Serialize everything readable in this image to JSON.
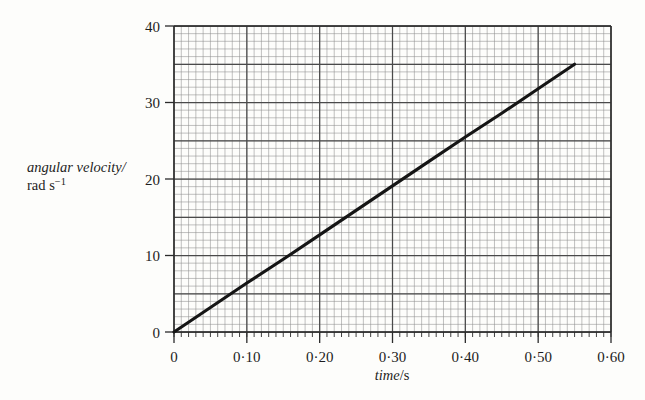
{
  "figure": {
    "background_color": "#fdfdfb",
    "ink_color": "#151515",
    "grid_minor_color": "#8d8d8d",
    "grid_major_color": "#4a4a4a"
  },
  "ghost_artifacts": {
    "top": "",
    "left_line1": "",
    "left_line2": ""
  },
  "axes": {
    "y_title_line1": "angular velocity/",
    "y_title_line2_main": "rad s",
    "y_title_line2_sup": "−1",
    "x_title_italic": "time",
    "x_title_rest": "/s"
  },
  "chart_data": {
    "type": "line",
    "title": "",
    "xlabel": "time/s",
    "ylabel": "angular velocity/rad s−1",
    "xlim": [
      0,
      0.6
    ],
    "ylim": [
      0,
      40
    ],
    "grid": true,
    "grid_major_x_step": 0.1,
    "grid_minor_x_step": 0.01,
    "grid_major_y_step": 5,
    "grid_minor_y_step": 1,
    "legend": "none",
    "x_ticks": [
      0,
      0.1,
      0.2,
      0.3,
      0.4,
      0.5,
      0.6
    ],
    "x_tick_labels": [
      "0",
      "0·10",
      "0·20",
      "0·30",
      "0·40",
      "0·50",
      "0·60"
    ],
    "y_ticks": [
      0,
      10,
      20,
      30,
      40
    ],
    "y_tick_labels": [
      "0",
      "10",
      "20",
      "30",
      "40"
    ],
    "series": [
      {
        "name": "angular velocity",
        "color": "#151515",
        "x": [
          0.0,
          0.05,
          0.1,
          0.15,
          0.2,
          0.25,
          0.3,
          0.35,
          0.4,
          0.45,
          0.5,
          0.55
        ],
        "values": [
          0.0,
          3.2,
          6.4,
          9.5,
          12.7,
          15.9,
          19.1,
          22.3,
          25.5,
          28.6,
          31.8,
          35.0
        ]
      }
    ],
    "annotations": [],
    "slope": 63.6,
    "slope_units": "rad s−2",
    "intercept": 0
  }
}
